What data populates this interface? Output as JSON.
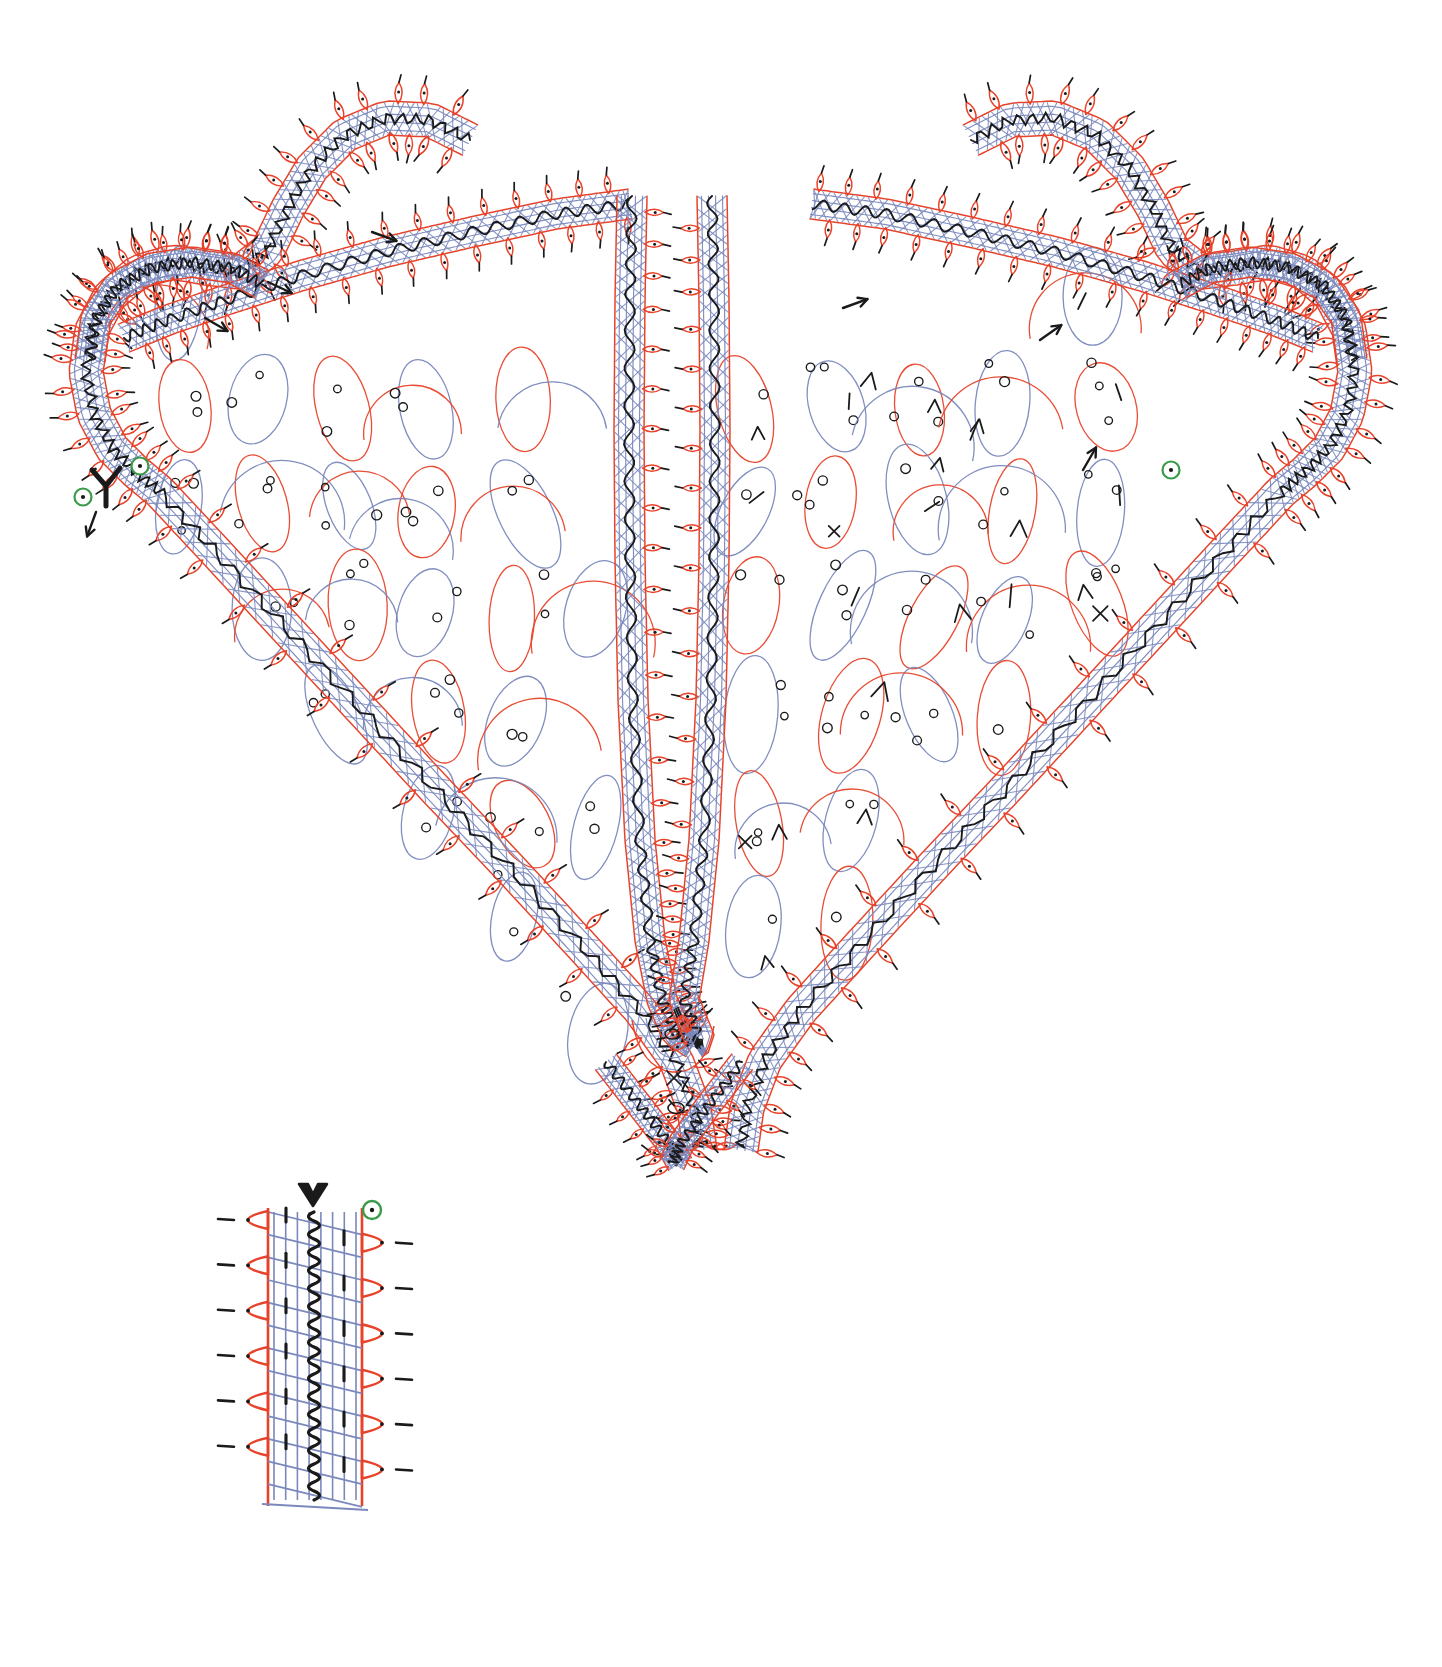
{
  "document": {
    "title": "Bobbin Lace Working Diagram — Heart / Shawl-point Motif",
    "subject": "bobbin-lace-working-diagram",
    "background_color": "#ffffff",
    "width": 1442,
    "height": 1667
  },
  "palette": {
    "pair_red": "#e8432a",
    "pair_blue": "#7a88bc",
    "gimp_black": "#1a1a1a",
    "start_marker_green": "#3a9b4a",
    "paper_white": "#ffffff"
  },
  "legend": {
    "thread_classes": [
      {
        "name": "worker-pair-red",
        "color": "#e8432a",
        "description": "red pair path"
      },
      {
        "name": "passive-pair-blue",
        "color": "#7a88bc",
        "description": "blue passive / crossing pair"
      },
      {
        "name": "gimp-thread-black",
        "color": "#1a1a1a",
        "description": "black wavy gimp thread"
      },
      {
        "name": "pin-dot",
        "color": "#1a1a1a",
        "description": "pin position dot"
      },
      {
        "name": "start-marker",
        "color": "#3a9b4a",
        "description": "green circled start pin"
      }
    ],
    "filling_symbols": [
      {
        "symbol": "o",
        "name": "pin-hole-dot"
      },
      {
        "symbol": "x",
        "name": "cross-stitch-mark"
      },
      {
        "symbol": "^",
        "name": "chevron-twist-mark"
      },
      {
        "symbol": "/",
        "name": "tally-slash-mark"
      }
    ]
  },
  "main_motif": {
    "name": "heart-shaped-shawl-point",
    "outline_description": "Scalloped twin-lobed top narrowing to a deep V point, worked as a picot-edged braid/tape.",
    "braid_bands": 6,
    "center_spine": {
      "name": "central-vertical-tape",
      "description": "double vertical tape running from split at top to rounded return near the point"
    },
    "start_markers": [
      {
        "id": "start-left",
        "x": 140,
        "y": 466
      },
      {
        "id": "start-left-outer",
        "x": 83,
        "y": 497
      },
      {
        "id": "start-right",
        "x": 1171,
        "y": 470
      }
    ],
    "direction_arrows": [
      {
        "x": 205,
        "y": 318,
        "angle": 30
      },
      {
        "x": 372,
        "y": 232,
        "angle": 20
      },
      {
        "x": 268,
        "y": 282,
        "angle": 25
      },
      {
        "x": 96,
        "y": 512,
        "angle": 110
      },
      {
        "x": 843,
        "y": 308,
        "angle": -20
      },
      {
        "x": 1040,
        "y": 340,
        "angle": -35
      },
      {
        "x": 1083,
        "y": 470,
        "angle": -60
      }
    ]
  },
  "detail_swatch": {
    "name": "braid-structure-detail",
    "description": "Enlarged sample of the picot-edged braid showing red edge pairs, blue passive crossings, black gimp and pin dots.",
    "x": 240,
    "y": 1190,
    "width": 170,
    "height": 310,
    "rows": 6,
    "start_marker": {
      "x": 372,
      "y": 1210
    },
    "entry_arrow": {
      "x": 313,
      "y": 1196
    }
  },
  "chart_data": {
    "type": "scatter",
    "xlabel": "",
    "ylabel": "",
    "note": "Technical lace pricking: thread-path tracing, not a quantitative plot."
  }
}
